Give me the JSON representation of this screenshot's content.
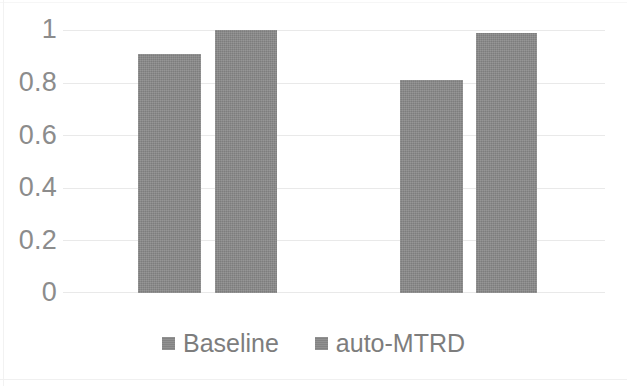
{
  "chart_data": {
    "type": "bar",
    "title": "",
    "subtitle": "",
    "xlabel": "",
    "ylabel": "",
    "categories": [
      "Group 1",
      "Group 2"
    ],
    "series": [
      {
        "name": "Baseline",
        "values": [
          0.91,
          0.81
        ],
        "color": "#8a8a8a"
      },
      {
        "name": "auto-MTRD",
        "values": [
          1.0,
          0.99
        ],
        "color": "#8a8a8a"
      }
    ],
    "ylim": [
      0,
      1
    ],
    "y_ticks": [
      1,
      0.8,
      0.6,
      0.4,
      0.2,
      0
    ],
    "y_tick_labels": [
      "1",
      "0.8",
      "0.6",
      "0.4",
      "0.2",
      "0"
    ],
    "x_tick_labels": [
      "",
      ""
    ],
    "grid": true,
    "grid_axis": "y",
    "grid_color": "#e9e9e9",
    "legend": true,
    "legend_position": "bottom",
    "legend_entries": [
      "Baseline",
      "auto-MTRD"
    ],
    "bar_color": "#8a8a8a",
    "background": "#ffffff",
    "annotations": []
  },
  "axis": {
    "y_ticks": [
      {
        "label": "1",
        "value": 1.0
      },
      {
        "label": "0.8",
        "value": 0.8
      },
      {
        "label": "0.6",
        "value": 0.6
      },
      {
        "label": "0.4",
        "value": 0.4
      },
      {
        "label": "0.2",
        "value": 0.2
      },
      {
        "label": "0",
        "value": 0.0
      }
    ]
  },
  "bars": [
    {
      "series": "Baseline",
      "group": 0,
      "value": 0.91,
      "left": 138,
      "width": 63
    },
    {
      "series": "auto-MTRD",
      "group": 0,
      "value": 1.0,
      "left": 215,
      "width": 62
    },
    {
      "series": "Baseline",
      "group": 1,
      "value": 0.81,
      "left": 400,
      "width": 63
    },
    {
      "series": "auto-MTRD",
      "group": 1,
      "value": 0.99,
      "left": 476,
      "width": 61
    }
  ],
  "legend": {
    "items": [
      {
        "label": "Baseline",
        "color": "#8a8a8a",
        "marker": "square-swatch"
      },
      {
        "label": "auto-MTRD",
        "color": "#8a8a8a",
        "marker": "square-swatch"
      }
    ]
  }
}
